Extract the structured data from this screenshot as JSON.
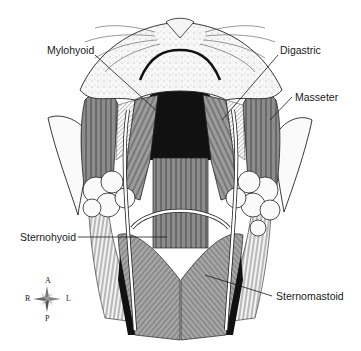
{
  "diagram": {
    "labels": {
      "mylohyoid": "Mylohyoid",
      "digastric": "Digastric",
      "masseter": "Masseter",
      "sternohyoid": "Sternohyoid",
      "sternomastoid": "Sternomastoid"
    },
    "compass": {
      "anterior": "A",
      "posterior": "P",
      "right": "R",
      "left": "L"
    },
    "colors": {
      "muscle_dark": "#6e6e6e",
      "muscle_mid": "#9a9a9a",
      "muscle_light": "#b8b8b8",
      "cavity": "#111111",
      "skin": "#f4f4f4",
      "line": "#1a1a1a"
    }
  }
}
